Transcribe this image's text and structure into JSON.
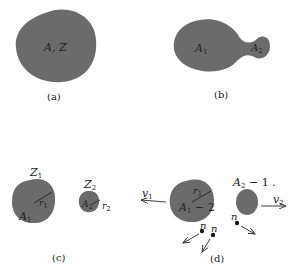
{
  "colors": {
    "nucleus_fill": "#6b6b6b",
    "line": "#2a2a2a",
    "background": "#ffffff"
  },
  "panels": {
    "a": {
      "caption": "(a)",
      "nucleus_label": "A, Z"
    },
    "b": {
      "caption": "(b)",
      "lobe1_label": "A",
      "lobe1_sub": "1",
      "lobe2_label": "A",
      "lobe2_sub": "2"
    },
    "c": {
      "caption": "(c)",
      "frag1_charge": "Z",
      "frag1_charge_sub": "1",
      "frag1_mass": "A",
      "frag1_mass_sub": "1",
      "frag1_radius": "r",
      "frag1_radius_sub": "1",
      "frag2_charge": "Z",
      "frag2_charge_sub": "2",
      "frag2_mass": "A",
      "frag2_mass_sub": "2",
      "frag2_radius": "r",
      "frag2_radius_sub": "2"
    },
    "d": {
      "caption": "(d)",
      "frag1_mass": "A",
      "frag1_mass_sub": "1",
      "frag1_mass_suffix": " − 2",
      "frag1_radius": "r",
      "frag1_radius_sub": "1",
      "frag1_velocity": "v",
      "frag1_velocity_sub": "1",
      "frag2_mass": "A",
      "frag2_mass_sub": "2",
      "frag2_mass_suffix": " − 1 .",
      "frag2_velocity": "v",
      "frag2_velocity_sub": "2",
      "neutron_label": "n",
      "neutron_count": 3
    }
  }
}
